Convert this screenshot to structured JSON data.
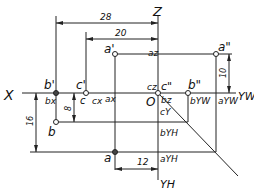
{
  "axes": {
    "x": "X",
    "z": "Z",
    "yw": "YW",
    "yh": "YH",
    "origin": "O"
  },
  "points": {
    "a_v": "a'",
    "a_s": "a\"",
    "a_h": "a",
    "b_v": "b'",
    "b_s": "b\"",
    "b_h": "b",
    "c_v": "c'",
    "c_s": "c\"",
    "c_h": "c"
  },
  "projections": {
    "ax": "ax",
    "az": "az",
    "ayw": "aYW",
    "ayh": "aYH",
    "bx": "bx",
    "bz": "bz",
    "byw": "bYW",
    "byh": "bYH",
    "cx": "cx",
    "cz": "cz",
    "cy": "cY"
  },
  "dimensions": {
    "d28": "28",
    "d20": "20",
    "d10": "10",
    "d8": "8",
    "d16": "16",
    "d12": "12"
  }
}
